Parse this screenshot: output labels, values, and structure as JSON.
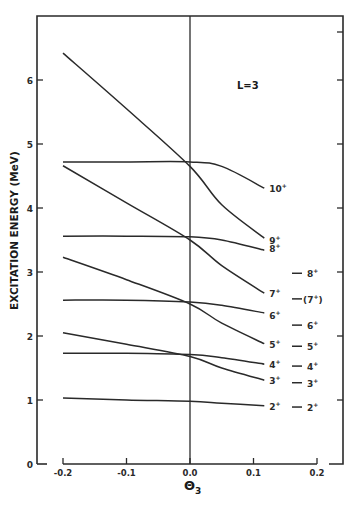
{
  "chart_data": {
    "type": "line",
    "title": "",
    "annotation": "L=3",
    "xlabel": "Θ3",
    "ylabel": "EXCITATION ENERGY (MeV)",
    "xlim": [
      -0.2,
      0.2
    ],
    "ylim": [
      0,
      7
    ],
    "xticks": [
      "-0.2",
      "-0.1",
      "0.0",
      "0.1",
      "0.2"
    ],
    "yticks": [
      "0",
      "1",
      "2",
      "3",
      "4",
      "5",
      "6"
    ],
    "grid": false,
    "legend": "none",
    "x": [
      -0.2,
      -0.1,
      0.0,
      0.05,
      0.117
    ],
    "series": [
      {
        "name": "10+",
        "values": [
          4.72,
          4.72,
          4.72,
          4.65,
          4.31
        ]
      },
      {
        "name": "9+",
        "values": [
          6.42,
          5.55,
          4.65,
          4.05,
          3.53
        ]
      },
      {
        "name": "8+",
        "values": [
          3.56,
          3.56,
          3.55,
          3.5,
          3.34
        ]
      },
      {
        "name": "7+",
        "values": [
          4.66,
          4.08,
          3.5,
          3.1,
          2.67
        ]
      },
      {
        "name": "6+",
        "values": [
          2.56,
          2.56,
          2.53,
          2.48,
          2.36
        ]
      },
      {
        "name": "5+",
        "values": [
          3.23,
          2.88,
          2.5,
          2.2,
          1.88
        ]
      },
      {
        "name": "4+",
        "values": [
          1.73,
          1.73,
          1.71,
          1.66,
          1.56
        ]
      },
      {
        "name": "3+",
        "values": [
          2.05,
          1.87,
          1.68,
          1.5,
          1.31
        ]
      },
      {
        "name": "2+",
        "values": [
          1.03,
          1.0,
          0.98,
          0.95,
          0.91
        ]
      }
    ],
    "experimental_levels": [
      {
        "label": "8+",
        "energy": 2.98
      },
      {
        "label": "(7+)",
        "energy": 2.58
      },
      {
        "label": "6+",
        "energy": 2.17
      },
      {
        "label": "5+",
        "energy": 1.84
      },
      {
        "label": "4+",
        "energy": 1.53
      },
      {
        "label": "3+",
        "energy": 1.27
      },
      {
        "label": "2+",
        "energy": 0.89
      }
    ]
  },
  "labels": {
    "ylabel": "EXCITATION ENERGY (MeV)",
    "xlabel_main": "Θ",
    "xlabel_sub": "3",
    "annotation": "L=3"
  }
}
